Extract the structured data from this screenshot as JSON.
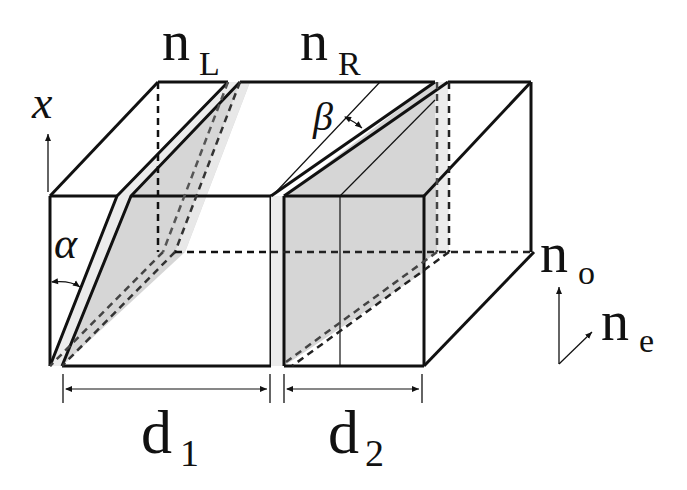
{
  "diagram": {
    "labels": {
      "n_L": {
        "main": "n",
        "sub": "L"
      },
      "n_R": {
        "main": "n",
        "sub": "R"
      },
      "n_o": {
        "main": "n",
        "sub": "o"
      },
      "n_e": {
        "main": "n",
        "sub": "e"
      },
      "d_1": {
        "main": "d",
        "sub": "1"
      },
      "d_2": {
        "main": "d",
        "sub": "2"
      },
      "x_axis": "x",
      "alpha": "α",
      "beta": "β"
    },
    "colors": {
      "stroke": "#111111",
      "shade": "#d6d6d6",
      "slab": "#ececec",
      "background": "#ffffff"
    },
    "components": [
      {
        "name": "left-prism",
        "width_label": "d_1",
        "index_label": "n_L",
        "angle_label": "alpha"
      },
      {
        "name": "right-prism",
        "width_label": "d_2",
        "index_label": "n_R",
        "angle_label": "beta"
      }
    ]
  }
}
